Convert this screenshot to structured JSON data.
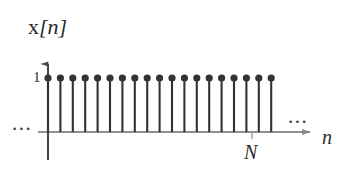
{
  "figure": {
    "kind": "discrete-time-signal-stem-plot",
    "background_color": "#ffffff",
    "ink_color": "#333333",
    "axis_color": "#808080",
    "signal_label_roman": "x",
    "signal_label_italic": "[n]",
    "amplitude_tick_label": "1",
    "period_label": "N",
    "index_axis_label": "n",
    "ellipsis_left": "...",
    "ellipsis_right": "..."
  },
  "chart_data": {
    "type": "line",
    "subtype": "stem",
    "title": "",
    "subtitle": "",
    "xlabel": "n",
    "ylabel": "x[n]",
    "x": [
      0,
      1,
      2,
      3,
      4,
      5,
      6,
      7,
      8,
      9,
      10,
      11,
      12,
      13,
      14,
      15,
      16,
      17,
      18
    ],
    "values": [
      1,
      1,
      1,
      1,
      1,
      1,
      1,
      1,
      1,
      1,
      1,
      1,
      1,
      1,
      1,
      1,
      1,
      1,
      1
    ],
    "ytick_labels": [
      "1"
    ],
    "ytick_values": [
      1
    ],
    "xtick_labels": [
      "N"
    ],
    "xtick_values": [
      17
    ],
    "xlim": [
      -1,
      22
    ],
    "ylim": [
      0,
      1.35
    ],
    "grid": false,
    "legend": false,
    "legend_position": "none",
    "marker": "filled-circle",
    "annotations": [
      {
        "text": "...",
        "position": "left-of-axis",
        "meaning": "signal continues to n = -infinity"
      },
      {
        "text": "...",
        "position": "right-of-stems",
        "meaning": "signal continues to n = +infinity"
      },
      {
        "text": "N",
        "position": "below-x-axis",
        "meaning": "period marker tick on n axis"
      }
    ]
  },
  "geometry": {
    "origin_x": 48,
    "baseline_y": 132,
    "stem_top_y": 78,
    "stem_spacing": 12.4,
    "stem_count": 19,
    "y_axis_top_y": 58,
    "x_axis_end_x": 316,
    "period_tick_x": 252,
    "marker_radius": 3.6
  }
}
